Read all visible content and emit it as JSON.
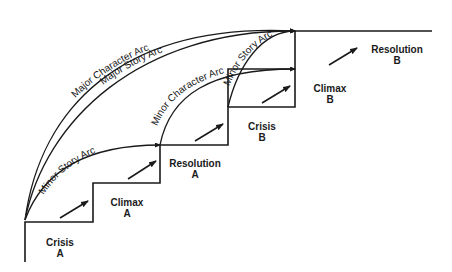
{
  "diagram": {
    "type": "story-structure-staircase",
    "colors": {
      "line": "#1a1a1a",
      "background": "#ffffff"
    },
    "steps": [
      {
        "name": "Crisis",
        "letter": "A"
      },
      {
        "name": "Climax",
        "letter": "A"
      },
      {
        "name": "Resolution",
        "letter": "A"
      },
      {
        "name": "Crisis",
        "letter": "B"
      },
      {
        "name": "Climax",
        "letter": "B"
      },
      {
        "name": "Resolution",
        "letter": "B"
      }
    ],
    "arcs": {
      "major_character": "Major Character Arc",
      "major_story": "Major Story Arc",
      "minor_story_1": "Minor Story Arc",
      "minor_character": "Minor Character Arc",
      "minor_story_2": "Minor Story Arc"
    }
  }
}
